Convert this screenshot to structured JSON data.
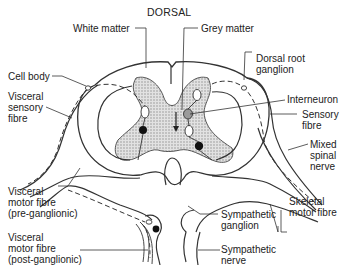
{
  "diagram": {
    "title": "DORSAL",
    "labels": {
      "white_matter": "White matter",
      "grey_matter": "Grey matter",
      "dorsal_root_ganglion": [
        "Dorsal root",
        "ganglion"
      ],
      "cell_body": "Cell body",
      "visceral_sensory_fibre": [
        "Visceral",
        "sensory",
        "fibre"
      ],
      "interneuron": "Interneuron",
      "sensory_fibre": [
        "Sensory",
        "fibre"
      ],
      "mixed_spinal_nerve": [
        "Mixed",
        "spinal",
        "nerve"
      ],
      "skeletal_motor_fibre": [
        "Skeletal",
        "motor fibre"
      ],
      "visceral_motor_pre": [
        "Visceral",
        "motor fibre",
        "(pre-ganglionic)"
      ],
      "visceral_motor_post": [
        "Visceral",
        "motor fibre",
        "(post-ganglionic)"
      ],
      "sympathetic_ganglion": [
        "Sympathetic",
        "ganglion"
      ],
      "sympathetic_nerve": [
        "Sympathetic",
        "nerve"
      ]
    },
    "colors": {
      "line": "#333333",
      "grey_matter_fill": "#d4d4d4",
      "neuron_filled": "#111111",
      "interneuron_fill": "#9a9a9a"
    }
  }
}
